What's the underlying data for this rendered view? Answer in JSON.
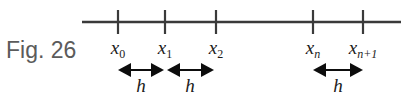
{
  "figure": {
    "caption": "Fig. 26",
    "background_color": "#ffffff",
    "line_color": "#3a3a3a",
    "text_color": "#1b1b1b",
    "caption_color": "#5b5b5b",
    "axis": {
      "name": "number-line",
      "x_start": 82,
      "x_end": 401,
      "y": 22,
      "stroke_width": 2.6
    },
    "ticks": [
      {
        "id": "tick-x0",
        "x": 118,
        "label_main": "x",
        "label_sub": "0"
      },
      {
        "id": "tick-x1",
        "x": 165,
        "label_main": "x",
        "label_sub": "1"
      },
      {
        "id": "tick-x2",
        "x": 216,
        "label_main": "x",
        "label_sub": "2"
      },
      {
        "id": "tick-xn",
        "x": 313,
        "label_main": "x",
        "label_sub": "n"
      },
      {
        "id": "tick-xn1",
        "x": 363,
        "label_main": "x",
        "label_sub": "n+1"
      }
    ],
    "tick_geometry": {
      "top": 10,
      "bottom": 34,
      "stroke_width": 2.2,
      "label_y": 38
    },
    "arrows": [
      {
        "id": "arrow-h-0",
        "x_left": 118,
        "x_right": 164,
        "y": 70,
        "label": "h",
        "label_x": 141,
        "label_y": 76
      },
      {
        "id": "arrow-h-1",
        "x_left": 167,
        "x_right": 214,
        "y": 70,
        "label": "h",
        "label_x": 190,
        "label_y": 76
      },
      {
        "id": "arrow-h-2",
        "x_left": 313,
        "x_right": 363,
        "y": 70,
        "label": "h",
        "label_x": 338,
        "label_y": 76
      }
    ],
    "arrow_geometry": {
      "shaft_width": 2.0,
      "head_length": 13,
      "head_half_height": 7
    },
    "labels": {
      "x0": "x0",
      "x1": "x1",
      "x2": "x2",
      "xn": "xn",
      "xn1": "xn+1",
      "h": "h"
    }
  }
}
